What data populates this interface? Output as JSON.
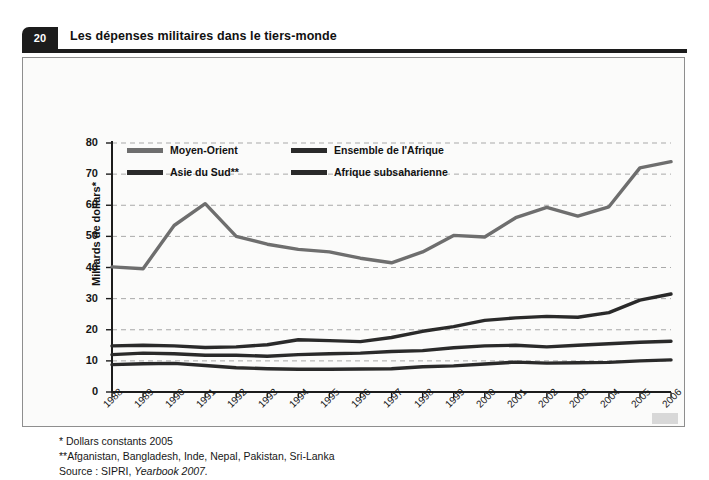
{
  "header": {
    "number": "20",
    "title": "Les dépenses militaires dans le tiers-monde"
  },
  "axes": {
    "y_label": "Milliards de dollars*",
    "y_ticks": [
      "0",
      "10",
      "20",
      "30",
      "40",
      "50",
      "60",
      "70",
      "80"
    ],
    "x_ticks": [
      "1988",
      "1989",
      "1990",
      "1991",
      "1992",
      "1993",
      "1994",
      "1995",
      "1996",
      "1997",
      "1998",
      "1999",
      "2000",
      "2001",
      "2002",
      "2003",
      "2004",
      "2005",
      "2006"
    ]
  },
  "legend": [
    {
      "label": "Moyen-Orient",
      "color": "#6e6e6e"
    },
    {
      "label": "Asie du Sud**",
      "color": "#2a2a2a"
    },
    {
      "label": "Ensemble de l'Afrique",
      "color": "#2a2a2a"
    },
    {
      "label": "Afrique subsaharienne",
      "color": "#2a2a2a"
    }
  ],
  "notes": {
    "note1": "* Dollars constants 2005",
    "note2": "**Afganistan, Bangladesh, Inde, Nepal, Pakistan, Sri-Lanka",
    "source_prefix": "Source : SIPRI, ",
    "source_italic": "Yearbook 2007."
  },
  "chart_data": {
    "type": "line",
    "title": "Les dépenses militaires dans le tiers-monde",
    "xlabel": "",
    "ylabel": "Milliards de dollars*",
    "xlim": [
      1988,
      2006
    ],
    "ylim": [
      0,
      80
    ],
    "ytick_step": 10,
    "grid": true,
    "legend_position": "top-left inside plot",
    "x": [
      1988,
      1989,
      1990,
      1991,
      1992,
      1993,
      1994,
      1995,
      1996,
      1997,
      1998,
      1999,
      2000,
      2001,
      2002,
      2003,
      2004,
      2005,
      2006
    ],
    "series": [
      {
        "name": "Moyen-Orient",
        "color": "#6e6e6e",
        "values": [
          40.2,
          39.6,
          53.5,
          60.5,
          50.0,
          47.5,
          45.8,
          45.0,
          43.0,
          41.5,
          45.0,
          50.3,
          49.8,
          56.0,
          59.3,
          56.5,
          59.5,
          72.0,
          74.0
        ]
      },
      {
        "name": "Ensemble de l'Afrique",
        "color": "#2a2a2a",
        "values": [
          14.8,
          15.0,
          14.8,
          14.3,
          14.5,
          15.2,
          16.8,
          16.5,
          16.2,
          17.5,
          19.5,
          21.0,
          23.0,
          23.8,
          24.3,
          24.0,
          25.5,
          29.5,
          31.5
        ]
      },
      {
        "name": "Asie du Sud**",
        "color": "#2a2a2a",
        "values": [
          12.0,
          12.5,
          12.3,
          11.8,
          11.8,
          11.5,
          12.0,
          12.3,
          12.5,
          13.0,
          13.3,
          14.2,
          14.8,
          15.0,
          14.5,
          15.0,
          15.5,
          16.0,
          16.3
        ]
      },
      {
        "name": "Afrique subsaharienne",
        "color": "#2a2a2a",
        "values": [
          8.8,
          9.1,
          9.2,
          8.5,
          7.8,
          7.5,
          7.3,
          7.3,
          7.4,
          7.5,
          8.1,
          8.4,
          9.0,
          9.6,
          9.3,
          9.4,
          9.5,
          10.0,
          10.3
        ]
      }
    ]
  }
}
